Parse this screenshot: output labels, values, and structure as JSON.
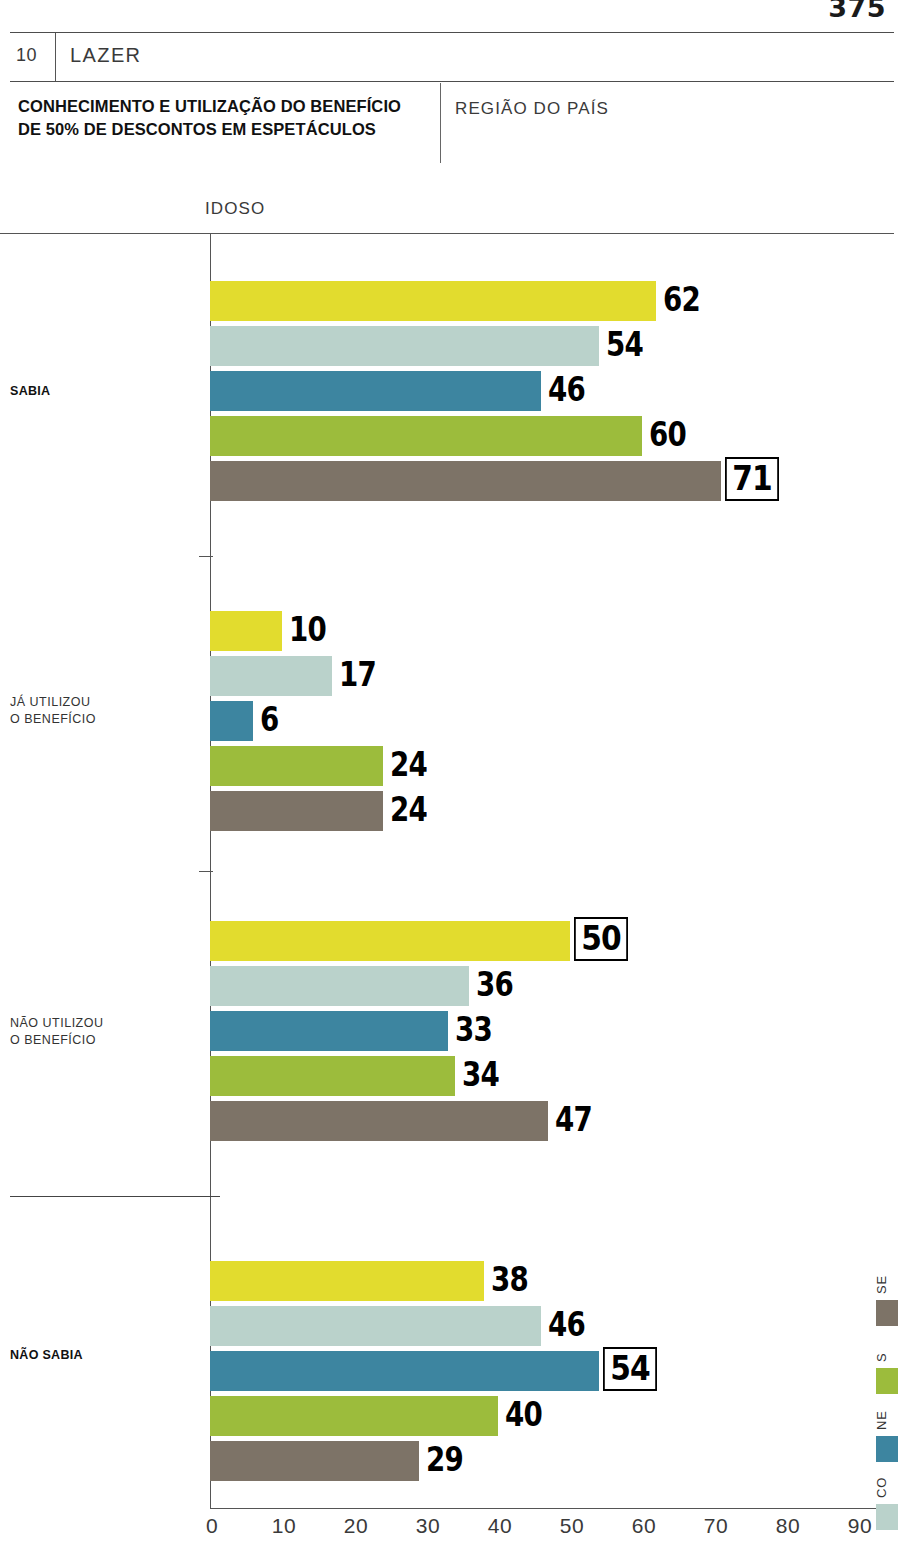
{
  "page": {
    "number": "375"
  },
  "header": {
    "chapter_number": "10",
    "chapter_name": "LAZER",
    "title": "CONHECIMENTO E UTILIZAÇÃO DO BENEFÍCIO DE 50% DE DESCONTOS EM ESPETÁCULOS",
    "subtitle": "REGIÃO DO PAÍS",
    "series_label": "IDOSO"
  },
  "chart_data": {
    "type": "bar",
    "orientation": "horizontal",
    "title": "CONHECIMENTO E UTILIZAÇÃO DO BENEFÍCIO DE 50% DE DESCONTOS EM ESPETÁCULOS",
    "subtitle": "REGIÃO DO PAÍS",
    "series_group": "IDOSO",
    "xlabel": "",
    "ylabel": "",
    "xlim": [
      0,
      90
    ],
    "xticks": [
      "0",
      "10",
      "20",
      "30",
      "40",
      "50",
      "60",
      "70",
      "80",
      "90"
    ],
    "grid": false,
    "legend_position": "right",
    "categories": [
      "SABIA",
      "JÁ UTILIZOU O BENEFÍCIO",
      "NÃO UTILIZOU O BENEFÍCIO",
      "NÃO SABIA"
    ],
    "series": [
      {
        "name": "N",
        "color": "#E2DC2E",
        "values": [
          62,
          10,
          50,
          38
        ]
      },
      {
        "name": "CO",
        "color": "#BAD2CB",
        "values": [
          54,
          17,
          36,
          46
        ]
      },
      {
        "name": "NE",
        "color": "#3D85A0",
        "values": [
          46,
          6,
          33,
          54
        ]
      },
      {
        "name": "S",
        "color": "#9CBC3C",
        "values": [
          60,
          24,
          34,
          40
        ]
      },
      {
        "name": "SE",
        "color": "#7D7367",
        "values": [
          71,
          24,
          47,
          29
        ]
      }
    ],
    "highlighted": [
      {
        "category": "SABIA",
        "series": "SE",
        "value": 71
      },
      {
        "category": "NÃO UTILIZOU O BENEFÍCIO",
        "series": "N",
        "value": 50
      },
      {
        "category": "NÃO SABIA",
        "series": "NE",
        "value": 54
      }
    ]
  },
  "groups": [
    {
      "label_line1": "SABIA",
      "label_line2": "",
      "bold": true,
      "bars": [
        {
          "series": "N",
          "value": "62",
          "boxed": false
        },
        {
          "series": "CO",
          "value": "54",
          "boxed": false
        },
        {
          "series": "NE",
          "value": "46",
          "boxed": false
        },
        {
          "series": "S",
          "value": "60",
          "boxed": false
        },
        {
          "series": "SE",
          "value": "71",
          "boxed": true
        }
      ]
    },
    {
      "label_line1": "JÁ UTILIZOU",
      "label_line2": "O BENEFÍCIO",
      "bold": false,
      "bars": [
        {
          "series": "N",
          "value": "10",
          "boxed": false
        },
        {
          "series": "CO",
          "value": "17",
          "boxed": false
        },
        {
          "series": "NE",
          "value": "6",
          "boxed": false
        },
        {
          "series": "S",
          "value": "24",
          "boxed": false
        },
        {
          "series": "SE",
          "value": "24",
          "boxed": false
        }
      ]
    },
    {
      "label_line1": "NÃO UTILIZOU",
      "label_line2": "O BENEFÍCIO",
      "bold": false,
      "bars": [
        {
          "series": "N",
          "value": "50",
          "boxed": true
        },
        {
          "series": "CO",
          "value": "36",
          "boxed": false
        },
        {
          "series": "NE",
          "value": "33",
          "boxed": false
        },
        {
          "series": "S",
          "value": "34",
          "boxed": false
        },
        {
          "series": "SE",
          "value": "47",
          "boxed": false
        }
      ]
    },
    {
      "label_line1": "NÃO SABIA",
      "label_line2": "",
      "bold": true,
      "bars": [
        {
          "series": "N",
          "value": "38",
          "boxed": false
        },
        {
          "series": "CO",
          "value": "46",
          "boxed": false
        },
        {
          "series": "NE",
          "value": "54",
          "boxed": true
        },
        {
          "series": "S",
          "value": "40",
          "boxed": false
        },
        {
          "series": "SE",
          "value": "29",
          "boxed": false
        }
      ]
    }
  ],
  "legend": {
    "items": [
      {
        "label": "SE",
        "color": "#7D7367"
      },
      {
        "label": "S",
        "color": "#9CBC3C"
      },
      {
        "label": "NE",
        "color": "#3D85A0"
      },
      {
        "label": "CO",
        "color": "#BAD2CB"
      },
      {
        "label": "N",
        "color": "#E2DC2E"
      }
    ]
  },
  "axis": {
    "ticks": [
      "0",
      "10",
      "20",
      "30",
      "40",
      "50",
      "60",
      "70",
      "80",
      "90"
    ]
  }
}
